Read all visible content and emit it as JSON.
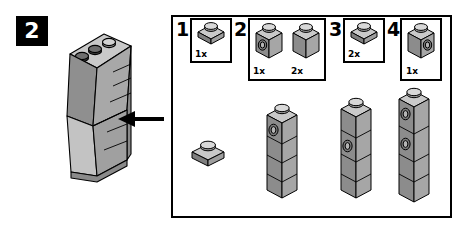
{
  "step": {
    "number": "2",
    "badge_bg": "#000000",
    "badge_fg": "#ffffff"
  },
  "arrow": {
    "icon": "arrow-left-icon",
    "direction": "left",
    "color": "#000000"
  },
  "colors": {
    "outline": "#000000",
    "paper": "#ffffff",
    "brick_top": "#d4d4d4",
    "brick_light": "#bdbdbd",
    "brick_mid": "#9c9c9c",
    "brick_dark": "#7d7d7d",
    "stud_top": "#d9d9d9",
    "stud_dark": "#3a3a3a"
  },
  "assembly": {
    "name": "angled-wall-assembly",
    "top_studs": 3,
    "description": "Tall angled wall sub-assembly with three studs on top"
  },
  "callouts": [
    {
      "number": "1",
      "parts": [
        {
          "type": "plate-1x1",
          "qty": "1x",
          "side_stud": false
        }
      ]
    },
    {
      "number": "2",
      "parts": [
        {
          "type": "brick-1x1-side-stud",
          "qty": "1x",
          "side_stud": true
        },
        {
          "type": "brick-1x1",
          "qty": "2x",
          "side_stud": false
        }
      ]
    },
    {
      "number": "3",
      "parts": [
        {
          "type": "plate-1x1",
          "qty": "2x",
          "side_stud": false
        }
      ]
    },
    {
      "number": "4",
      "parts": [
        {
          "type": "brick-1x1-side-stud",
          "qty": "1x",
          "side_stud": true
        }
      ]
    }
  ],
  "sub_builds": [
    {
      "name": "single-plate",
      "type": "plate-1x1",
      "bricks": 1,
      "side_stud_positions": []
    },
    {
      "name": "stack-a",
      "type": "brick-stack",
      "bricks": 4,
      "side_stud_positions": [
        0
      ]
    },
    {
      "name": "stack-b",
      "type": "brick-stack",
      "bricks": 4,
      "side_stud_positions": [
        1
      ]
    },
    {
      "name": "stack-c",
      "type": "brick-stack",
      "bricks": 5,
      "side_stud_positions": [
        0,
        2
      ]
    }
  ]
}
